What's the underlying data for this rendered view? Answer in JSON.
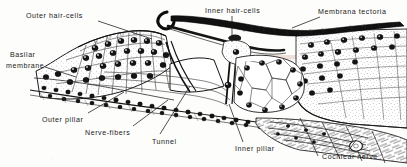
{
  "figure": {
    "kind": "anatomical-line-drawing",
    "width": 407,
    "height": 167,
    "background_color": "#fdfdfc",
    "ink_color": "#1a1a1a",
    "ghost_text_color": "#d9b7a8"
  },
  "labels": [
    {
      "id": "outer-hair-cells",
      "text": "Outer  hair-cells",
      "x": 26,
      "y": 12,
      "align": "left"
    },
    {
      "id": "inner-hair-cells",
      "text": "Inner  hair-cells",
      "x": 205,
      "y": 7,
      "align": "left"
    },
    {
      "id": "membrana-tectoria",
      "text": "Membrana  tectoria",
      "x": 318,
      "y": 8,
      "align": "left"
    },
    {
      "id": "basilar-membrane-line1",
      "text": "Basilar",
      "x": 10,
      "y": 51,
      "align": "left"
    },
    {
      "id": "basilar-membrane-line2",
      "text": "membrane",
      "x": 6,
      "y": 62,
      "align": "left"
    },
    {
      "id": "outer-pillar",
      "text": "Outer  pillar",
      "x": 42,
      "y": 116,
      "align": "left"
    },
    {
      "id": "nerve-fibers",
      "text": "Nerve-fibers",
      "x": 85,
      "y": 129,
      "align": "left"
    },
    {
      "id": "tunnel",
      "text": "Tunnel",
      "x": 152,
      "y": 138,
      "align": "left"
    },
    {
      "id": "inner-pillar",
      "text": "Inner  pillar",
      "x": 235,
      "y": 145,
      "align": "left"
    },
    {
      "id": "cochlear-nerve",
      "text": "Cochlear  nerve",
      "x": 322,
      "y": 153,
      "align": "left"
    }
  ],
  "structures": [
    {
      "id": "membrana-tectoria",
      "description": "dark hooked band sweeping from upper-left curl across to the right wall"
    },
    {
      "id": "basilar-membrane",
      "description": "thin double line running along the lower border of the epithelium"
    },
    {
      "id": "tunnel-of-corti",
      "description": "triangular clear space between inner and outer pillars"
    },
    {
      "id": "outer-pillar",
      "description": "slender rod leaning right, forming outer wall of the tunnel"
    },
    {
      "id": "inner-pillar",
      "description": "slender rod leaning left, forming inner wall of the tunnel"
    },
    {
      "id": "outer-hair-cells",
      "description": "row of nucleated cells on the left slope"
    },
    {
      "id": "inner-hair-cells",
      "description": "cells at the apex of the inner pillar"
    },
    {
      "id": "cochlear-nerve",
      "description": "bundle of nerve fibres entering from lower right"
    },
    {
      "id": "spiral-limbus",
      "description": "large cell mass occupying the right third of the field"
    }
  ],
  "ghost_text": "faint reverse-side print bleed-through in the upper middle-right"
}
